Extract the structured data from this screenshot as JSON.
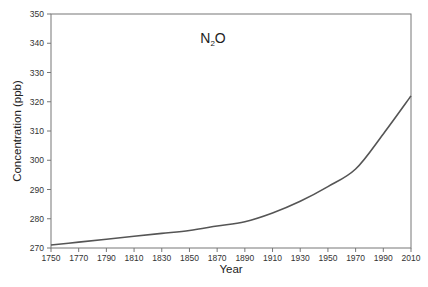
{
  "chart_data": {
    "type": "line",
    "title": "N2O",
    "title_main": "N",
    "title_subscript": "2",
    "title_tail": "O",
    "xlabel": "Year",
    "ylabel": "Concentration (ppb)",
    "xlim": [
      1750,
      2010
    ],
    "ylim": [
      270,
      350
    ],
    "x_ticks": [
      1750,
      1770,
      1790,
      1810,
      1830,
      1850,
      1870,
      1890,
      1910,
      1930,
      1950,
      1970,
      1990,
      2010
    ],
    "y_ticks": [
      270,
      280,
      290,
      300,
      310,
      320,
      330,
      340,
      350
    ],
    "grid": false,
    "legend": null,
    "series": [
      {
        "name": "N2O",
        "color": "#555555",
        "x": [
          1750,
          1770,
          1790,
          1810,
          1830,
          1850,
          1870,
          1890,
          1910,
          1930,
          1950,
          1970,
          1990,
          2010
        ],
        "values": [
          271,
          272,
          273,
          274,
          275,
          276,
          277.5,
          279,
          282,
          286,
          291,
          297,
          309,
          322
        ]
      }
    ]
  }
}
